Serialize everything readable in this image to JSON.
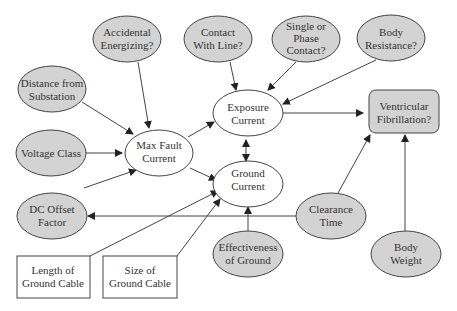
{
  "colors": {
    "gray_fill": "#d3d3d3",
    "white_fill": "#ffffff",
    "stroke": "#444444",
    "text": "#333333"
  },
  "nodes": {
    "accidental": {
      "line1": "Accidental",
      "line2": "Energizing?"
    },
    "contact_line": {
      "line1": "Contact",
      "line2": "With Line?"
    },
    "single_phase": {
      "line1": "Single or",
      "line2": "Phase",
      "line3": "Contact?"
    },
    "body_resistance": {
      "line1": "Body",
      "line2": "Resistance?"
    },
    "distance": {
      "line1": "Distance from",
      "line2": "Substation"
    },
    "voltage": {
      "line1": "Voltage Class"
    },
    "max_fault": {
      "line1": "Max Fault",
      "line2": "Current"
    },
    "exposure": {
      "line1": "Exposure",
      "line2": "Current"
    },
    "ground_current": {
      "line1": "Ground",
      "line2": "Current"
    },
    "ventricular": {
      "line1": "Ventricular",
      "line2": "Fibrillation?"
    },
    "dc_offset": {
      "line1": "DC Offset",
      "line2": "Factor"
    },
    "clearance": {
      "line1": "Clearance",
      "line2": "Time"
    },
    "effectiveness": {
      "line1": "Effectiveness",
      "line2": "of Ground"
    },
    "body_weight": {
      "line1": "Body",
      "line2": "Weight"
    },
    "length_cable": {
      "line1": "Length of",
      "line2": "Ground Cable"
    },
    "size_cable": {
      "line1": "Size of",
      "line2": "Ground Cable"
    }
  },
  "edges": [
    [
      "accidental",
      "max_fault"
    ],
    [
      "distance",
      "max_fault"
    ],
    [
      "voltage",
      "max_fault"
    ],
    [
      "dc_offset",
      "max_fault"
    ],
    [
      "max_fault",
      "exposure"
    ],
    [
      "max_fault",
      "ground_current"
    ],
    [
      "contact_line",
      "exposure"
    ],
    [
      "single_phase",
      "exposure"
    ],
    [
      "body_resistance",
      "exposure"
    ],
    [
      "exposure",
      "ventricular"
    ],
    [
      "exposure",
      "ground_current",
      "bidirectional"
    ],
    [
      "length_cable",
      "ground_current"
    ],
    [
      "size_cable",
      "ground_current"
    ],
    [
      "effectiveness",
      "ground_current"
    ],
    [
      "clearance",
      "ventricular"
    ],
    [
      "clearance",
      "dc_offset"
    ],
    [
      "body_weight",
      "ventricular"
    ]
  ]
}
